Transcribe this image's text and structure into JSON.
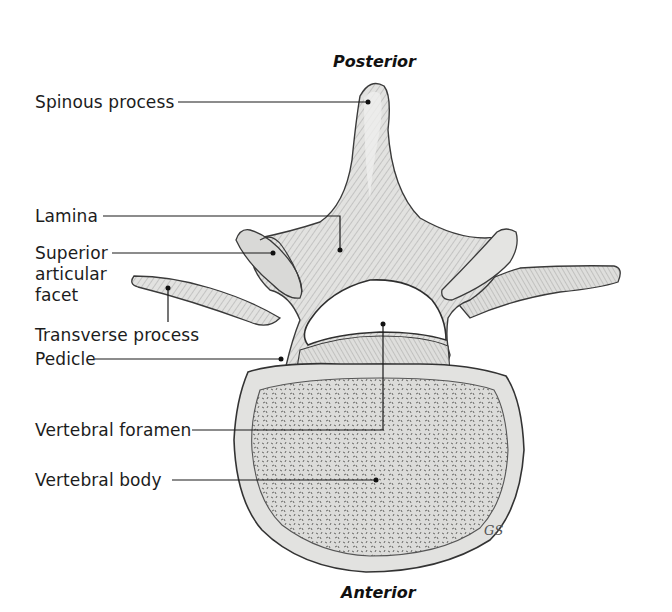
{
  "figure": {
    "orientation": {
      "top": "Posterior",
      "bottom": "Anterior"
    },
    "labels": [
      {
        "id": "spinous-process",
        "text": "Spinous process"
      },
      {
        "id": "lamina",
        "text": "Lamina"
      },
      {
        "id": "superior-articular-facet",
        "lines": [
          "Superior",
          "articular",
          "facet"
        ]
      },
      {
        "id": "transverse-process",
        "text": "Transverse process"
      },
      {
        "id": "pedicle",
        "text": "Pedicle"
      },
      {
        "id": "vertebral-foramen",
        "text": "Vertebral foramen"
      },
      {
        "id": "vertebral-body",
        "text": "Vertebral body"
      }
    ],
    "artist_signature": "GS",
    "colors": {
      "bone_fill": "#e6e6e4",
      "bone_shade": "#c9c9c6",
      "outline": "#3a3a3a",
      "leader_line": "#1a1a1a",
      "background": "#ffffff"
    }
  }
}
